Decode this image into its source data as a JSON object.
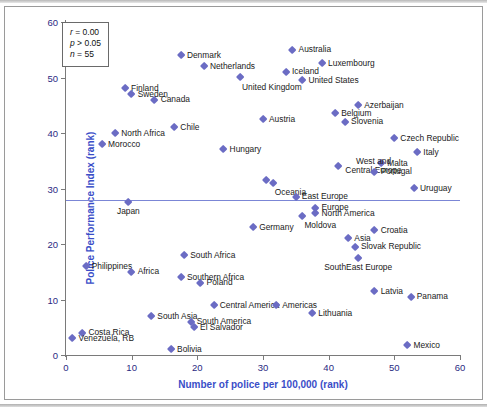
{
  "figure": {
    "marker_color": "#6b6cc4",
    "axis_title_color": "#3a4ec8",
    "ref_line_color": "#7b86d6"
  },
  "stats": {
    "r_label": "r",
    "r_value": "= 0.00",
    "p_label": "p",
    "p_value": "> 0.05",
    "n_label": "n",
    "n_value": "= 55"
  },
  "chart_data": {
    "type": "scatter",
    "title": "",
    "xlabel": "Number of police per 100,000 (rank)",
    "ylabel": "Police Performance Index (rank)",
    "xlim": [
      0,
      60
    ],
    "ylim": [
      0,
      60
    ],
    "xticks": [
      0,
      10,
      20,
      30,
      40,
      50,
      60
    ],
    "yticks": [
      0,
      10,
      20,
      30,
      40,
      50,
      60
    ],
    "grid": false,
    "legend": "none",
    "annotations": {
      "r": 0.0,
      "p": "> 0.05",
      "n": 55
    },
    "reference_line": {
      "type": "horizontal",
      "y": 28.0
    },
    "points": [
      {
        "label": "Denmark",
        "x": 17.5,
        "y": 54.0,
        "pos": "right"
      },
      {
        "label": "Australia",
        "x": 34.5,
        "y": 55.0,
        "pos": "right"
      },
      {
        "label": "Luxembourg",
        "x": 39.0,
        "y": 52.5,
        "pos": "right"
      },
      {
        "label": "Netherlands",
        "x": 21.0,
        "y": 52.0,
        "pos": "right"
      },
      {
        "label": "Iceland",
        "x": 33.5,
        "y": 51.0,
        "pos": "right"
      },
      {
        "label": "United Kingdom",
        "x": 26.5,
        "y": 50.0,
        "pos": "belowright"
      },
      {
        "label": "United States",
        "x": 36.0,
        "y": 49.5,
        "pos": "right"
      },
      {
        "label": "Finland",
        "x": 9.0,
        "y": 48.0,
        "pos": "right"
      },
      {
        "label": "Sweden",
        "x": 10.0,
        "y": 47.0,
        "pos": "right"
      },
      {
        "label": "Canada",
        "x": 13.5,
        "y": 46.0,
        "pos": "right"
      },
      {
        "label": "Azerbaijan",
        "x": 44.5,
        "y": 45.0,
        "pos": "right"
      },
      {
        "label": "Belgium",
        "x": 41.0,
        "y": 43.5,
        "pos": "right"
      },
      {
        "label": "Slovenia",
        "x": 42.5,
        "y": 42.0,
        "pos": "right"
      },
      {
        "label": "Austria",
        "x": 30.0,
        "y": 42.5,
        "pos": "right"
      },
      {
        "label": "Chile",
        "x": 16.5,
        "y": 41.0,
        "pos": "right"
      },
      {
        "label": "North Africa",
        "x": 7.5,
        "y": 40.0,
        "pos": "right"
      },
      {
        "label": "Czech Republic",
        "x": 50.0,
        "y": 39.0,
        "pos": "right"
      },
      {
        "label": "Morocco",
        "x": 5.5,
        "y": 38.0,
        "pos": "right"
      },
      {
        "label": "Hungary",
        "x": 24.0,
        "y": 37.0,
        "pos": "right"
      },
      {
        "label": "Italy",
        "x": 53.5,
        "y": 36.5,
        "pos": "right"
      },
      {
        "label": "Malta",
        "x": 48.0,
        "y": 34.5,
        "pos": "right"
      },
      {
        "label": "West and Central Europe",
        "x": 41.5,
        "y": 34.0,
        "pos": "right2"
      },
      {
        "label": "Portugal",
        "x": 47.0,
        "y": 33.0,
        "pos": "right"
      },
      {
        "label": "Oceania",
        "x": 31.5,
        "y": 31.0,
        "pos": "belowright"
      },
      {
        "label": "",
        "x": 30.5,
        "y": 31.5,
        "pos": "none"
      },
      {
        "label": "Uruguay",
        "x": 53.0,
        "y": 30.0,
        "pos": "right"
      },
      {
        "label": "East Europe",
        "x": 35.0,
        "y": 28.5,
        "pos": "right"
      },
      {
        "label": "Japan",
        "x": 9.5,
        "y": 27.5,
        "pos": "below"
      },
      {
        "label": "Europe",
        "x": 38.0,
        "y": 26.5,
        "pos": "right"
      },
      {
        "label": "North America",
        "x": 38.0,
        "y": 25.5,
        "pos": "right"
      },
      {
        "label": "Moldova",
        "x": 36.0,
        "y": 25.0,
        "pos": "belowright"
      },
      {
        "label": "Germany",
        "x": 28.5,
        "y": 23.0,
        "pos": "right"
      },
      {
        "label": "Croatia",
        "x": 47.0,
        "y": 22.5,
        "pos": "right"
      },
      {
        "label": "Asia",
        "x": 43.0,
        "y": 21.0,
        "pos": "right"
      },
      {
        "label": "Slovak Republic",
        "x": 44.0,
        "y": 19.5,
        "pos": "right"
      },
      {
        "label": "South Africa",
        "x": 18.0,
        "y": 18.0,
        "pos": "right"
      },
      {
        "label": "SouthEast Europe",
        "x": 44.5,
        "y": 17.5,
        "pos": "below"
      },
      {
        "label": "Philippines",
        "x": 3.0,
        "y": 16.0,
        "pos": "right"
      },
      {
        "label": "Africa",
        "x": 10.0,
        "y": 15.0,
        "pos": "right"
      },
      {
        "label": "Southern Africa",
        "x": 17.5,
        "y": 14.0,
        "pos": "right"
      },
      {
        "label": "Poland",
        "x": 20.5,
        "y": 13.0,
        "pos": "right"
      },
      {
        "label": "Latvia",
        "x": 47.0,
        "y": 11.5,
        "pos": "right"
      },
      {
        "label": "Panama",
        "x": 52.5,
        "y": 10.5,
        "pos": "right"
      },
      {
        "label": "Central America",
        "x": 22.5,
        "y": 9.0,
        "pos": "right"
      },
      {
        "label": "Americas",
        "x": 32.0,
        "y": 9.0,
        "pos": "right"
      },
      {
        "label": "Lithuania",
        "x": 37.5,
        "y": 7.5,
        "pos": "right"
      },
      {
        "label": "South Asia",
        "x": 13.0,
        "y": 7.0,
        "pos": "right"
      },
      {
        "label": "South America",
        "x": 19.0,
        "y": 6.0,
        "pos": "right"
      },
      {
        "label": "El Salvador",
        "x": 19.5,
        "y": 5.0,
        "pos": "right"
      },
      {
        "label": "Costa Rica",
        "x": 2.5,
        "y": 4.0,
        "pos": "right"
      },
      {
        "label": "Venezuela, RB",
        "x": 1.0,
        "y": 3.0,
        "pos": "right"
      },
      {
        "label": "Mexico",
        "x": 52.0,
        "y": 1.8,
        "pos": "right"
      },
      {
        "label": "Bolivia",
        "x": 16.0,
        "y": 1.0,
        "pos": "right"
      }
    ]
  }
}
